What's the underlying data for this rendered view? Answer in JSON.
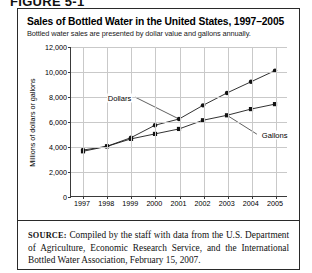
{
  "figure": {
    "caption": "FIGURE 5-1"
  },
  "chart_data": {
    "type": "line",
    "title": "Sales of Bottled Water in the United States, 1997–2005",
    "subtitle": "Bottled water sales are presented by dollar value and gallons annually.",
    "xlabel": "",
    "ylabel": "Millions of dollars or gallons",
    "categories": [
      "1997",
      "1998",
      "1999",
      "2000",
      "2001",
      "2002",
      "2003",
      "2004",
      "2005"
    ],
    "x": [
      1997,
      1998,
      1999,
      2000,
      2001,
      2002,
      2003,
      2004,
      2005
    ],
    "ylim": [
      0,
      12000
    ],
    "ytick_labels": [
      "0",
      "2,000",
      "4,000",
      "6,000",
      "8,000",
      "10,000",
      "12,000"
    ],
    "ytick_values": [
      0,
      2000,
      4000,
      6000,
      8000,
      10000,
      12000
    ],
    "grid": true,
    "legend_position": "inline-annotations",
    "series": [
      {
        "name": "Dollars",
        "marker": "circle",
        "values": [
          3700,
          4000,
          4700,
          5700,
          6200,
          7300,
          8300,
          9200,
          10100
        ]
      },
      {
        "name": "Gallons",
        "marker": "square",
        "values": [
          3600,
          4000,
          4600,
          5000,
          5400,
          6100,
          6500,
          7000,
          7400
        ]
      }
    ],
    "annotations": [
      {
        "text": "Dollars",
        "points_to": "2001 dollars point"
      },
      {
        "text": "Gallons",
        "points_to": "2003 gallons point"
      }
    ]
  },
  "source": {
    "prefix": "SOURCE:",
    "text": " Compiled by the staff with data from the U.S. Department of Agriculture, Economic Research Service, and the International Bottled Water Association, February 15, 2007."
  }
}
